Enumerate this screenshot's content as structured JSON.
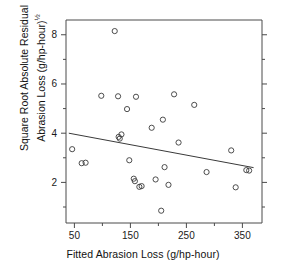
{
  "chart_data": {
    "type": "scatter",
    "title": "",
    "xlabel": "Fitted Abrasion Loss (g/hp-hour)",
    "ylabel_line1": "Square Root Absolute Residual",
    "ylabel_line2_text": "Abrasion Loss (g/hp-hour)",
    "ylabel_line2_sup": "½",
    "xlim": [
      35,
      385
    ],
    "ylim": [
      0.35,
      8.6
    ],
    "xticks": [
      50,
      150,
      250,
      350
    ],
    "yticks": [
      2,
      4,
      6,
      8
    ],
    "xtick_labels": [
      "50",
      "150",
      "250",
      "350"
    ],
    "ytick_labels": [
      "2",
      "4",
      "6",
      "8"
    ],
    "grid": false,
    "legend": "none",
    "marker": "open-circle",
    "x": [
      46,
      63,
      70,
      98,
      122,
      128,
      129,
      131,
      134,
      144,
      148,
      156,
      158,
      160,
      166,
      170,
      188,
      195,
      205,
      208,
      211,
      218,
      228,
      236,
      264,
      286,
      330,
      338,
      357,
      362
    ],
    "y": [
      3.35,
      2.78,
      2.8,
      5.52,
      8.15,
      5.5,
      3.85,
      3.78,
      3.95,
      4.98,
      2.9,
      2.15,
      2.05,
      5.48,
      1.82,
      1.85,
      4.22,
      2.12,
      0.85,
      4.55,
      2.62,
      1.9,
      5.58,
      3.62,
      5.15,
      2.42,
      3.3,
      1.8,
      2.5,
      2.48
    ],
    "fit_line": {
      "label": "least-squares fit",
      "x": [
        40,
        370
      ],
      "y": [
        4.0,
        2.6
      ]
    }
  }
}
